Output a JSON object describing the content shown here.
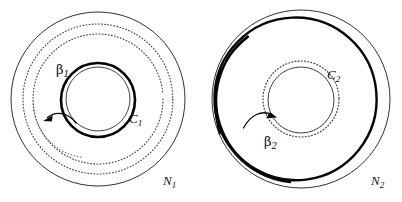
{
  "figure": {
    "caption_present": false,
    "background_color": "#ffffff",
    "stroke_color": "#111111",
    "panels": [
      {
        "id": "left",
        "region_label": "N",
        "region_label_subscript": "1",
        "region_label_text": "N₁",
        "center_x": 98,
        "center_y": 99,
        "boundary_radius": 87,
        "labels": [
          {
            "name": "beta-1",
            "text": "β",
            "subscript": "1",
            "x": 56,
            "y": 74
          },
          {
            "name": "c-1",
            "text": "C",
            "subscript": "1",
            "x": 129,
            "y": 123
          },
          {
            "name": "n-1",
            "text": "N",
            "subscript": "1",
            "x": 163,
            "y": 185
          }
        ],
        "curves": [
          {
            "name": "outer-boundary",
            "style": "solid-thin",
            "radius": 87
          },
          {
            "name": "beta-1-spiral",
            "style": "dotted",
            "turns": 2,
            "outer_radius": 75,
            "inner_radius": 54
          },
          {
            "name": "c-1-circle",
            "style": "solid-bold",
            "radius": 37
          },
          {
            "name": "c-1-inner-thin",
            "style": "solid-thin",
            "radius": 32
          },
          {
            "name": "arrow-beta-1",
            "style": "arrow",
            "from": "c-1-circle",
            "to": "beta-1-spiral",
            "direction": "outward-left"
          }
        ]
      },
      {
        "id": "right",
        "region_label": "N",
        "region_label_subscript": "2",
        "region_label_text": "N₂",
        "center_x": 301,
        "center_y": 99,
        "boundary_radius": 89,
        "labels": [
          {
            "name": "c-2",
            "text": "C",
            "subscript": "2",
            "x": 327,
            "y": 79
          },
          {
            "name": "beta-2",
            "text": "β",
            "subscript": "2",
            "x": 264,
            "y": 146
          },
          {
            "name": "n-2",
            "text": "N",
            "subscript": "2",
            "x": 371,
            "y": 185
          }
        ],
        "curves": [
          {
            "name": "outer-boundary",
            "style": "solid-thin",
            "radius": 89
          },
          {
            "name": "beta-2-spiral",
            "style": "solid-bold",
            "turns": 2,
            "outer_radius": 82,
            "inner_radius": 57
          },
          {
            "name": "c-2-circle",
            "style": "dotted",
            "radius": 38
          },
          {
            "name": "c-2-inner-thin",
            "style": "solid-thin",
            "radius": 33
          },
          {
            "name": "arrow-beta-2",
            "style": "arrow",
            "from": "beta-2-spiral",
            "to": "c-2-circle",
            "direction": "inward-right"
          }
        ]
      }
    ]
  }
}
